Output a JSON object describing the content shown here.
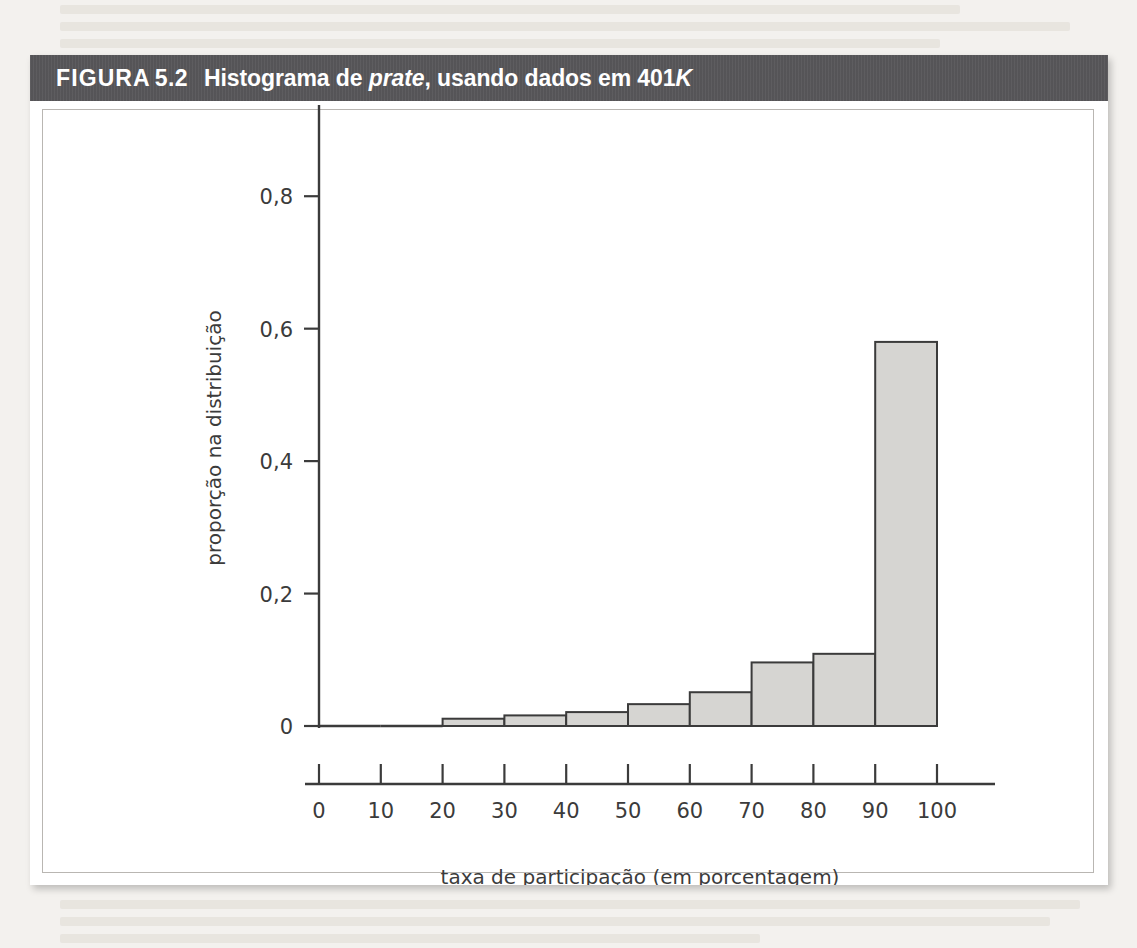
{
  "figure": {
    "label": "FIGURA",
    "number": "5.2",
    "caption_part1": "Histograma de ",
    "caption_italic1": "prate",
    "caption_part2": ", usando dados em 401",
    "caption_italic2": "K"
  },
  "chart_data": {
    "type": "bar",
    "title": "Histograma de prate, usando dados em 401K",
    "xlabel": "taxa de participação (em porcentagem)",
    "ylabel": "proporção na distribuição",
    "categories": [
      "0-10",
      "10-20",
      "20-30",
      "30-40",
      "40-50",
      "50-60",
      "60-70",
      "70-80",
      "80-90",
      "90-100"
    ],
    "bin_edges": [
      0,
      10,
      20,
      30,
      40,
      50,
      60,
      70,
      80,
      90,
      100
    ],
    "values": [
      0.0,
      0.0,
      0.011,
      0.016,
      0.021,
      0.033,
      0.051,
      0.096,
      0.109,
      0.58
    ],
    "xlim": [
      0,
      100
    ],
    "ylim": [
      0,
      0.9
    ],
    "xticks": [
      0,
      10,
      20,
      30,
      40,
      50,
      60,
      70,
      80,
      90,
      100
    ],
    "xtick_labels": [
      "0",
      "10",
      "20",
      "30",
      "40",
      "50",
      "60",
      "70",
      "80",
      "90",
      "100"
    ],
    "yticks": [
      0,
      0.2,
      0.4,
      0.6,
      0.8
    ],
    "ytick_labels": [
      "0",
      "0,2",
      "0,4",
      "0,6",
      "0,8"
    ],
    "grid": false,
    "legend": null,
    "bar_fill": "#d6d5d2",
    "bar_stroke": "#3b3b3b"
  },
  "colors": {
    "banner_bg": "#58575a",
    "banner_text": "#ffffff",
    "card_bg": "#ffffff",
    "page_bg": "#f3f1ee",
    "axis": "#3b3b3b"
  }
}
